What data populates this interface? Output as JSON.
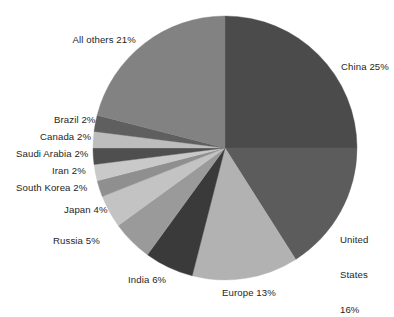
{
  "chart_data": {
    "type": "pie",
    "title": "",
    "subtitle": "",
    "xlabel": "",
    "ylabel": "",
    "legend_position": "none",
    "grid": false,
    "unit": "%",
    "start_angle_deg": 0,
    "direction": "clockwise",
    "categories": [
      "China",
      "United States",
      "Europe",
      "India",
      "Russia",
      "Japan",
      "South Korea",
      "Iran",
      "Saudi Arabia",
      "Canada",
      "Brazil",
      "All others"
    ],
    "values": [
      25,
      16,
      13,
      6,
      5,
      4,
      2,
      2,
      2,
      2,
      2,
      21
    ],
    "slices": [
      {
        "name": "China",
        "value": 25,
        "label": "China 25%",
        "label_lines": [
          "China 25%"
        ],
        "color": "#4b4b4b"
      },
      {
        "name": "United States",
        "value": 16,
        "label": "United States 16%",
        "label_lines": [
          "United",
          "States",
          "16%"
        ],
        "color": "#5c5c5c"
      },
      {
        "name": "Europe",
        "value": 13,
        "label": "Europe 13%",
        "label_lines": [
          "Europe 13%"
        ],
        "color": "#b2b2b2"
      },
      {
        "name": "India",
        "value": 6,
        "label": "India 6%",
        "label_lines": [
          "India 6%"
        ],
        "color": "#3a3a3a"
      },
      {
        "name": "Russia",
        "value": 5,
        "label": "Russia 5%",
        "label_lines": [
          "Russia 5%"
        ],
        "color": "#9a9a9a"
      },
      {
        "name": "Japan",
        "value": 4,
        "label": "Japan 4%",
        "label_lines": [
          "Japan 4%"
        ],
        "color": "#c3c3c3"
      },
      {
        "name": "South Korea",
        "value": 2,
        "label": "South Korea 2%",
        "label_lines": [
          "South Korea 2%"
        ],
        "color": "#8f8f8f"
      },
      {
        "name": "Iran",
        "value": 2,
        "label": "Iran 2%",
        "label_lines": [
          "Iran 2%"
        ],
        "color": "#c9c9c9"
      },
      {
        "name": "Saudi Arabia",
        "value": 2,
        "label": "Saudi Arabia 2%",
        "label_lines": [
          "Saudi Arabia 2%"
        ],
        "color": "#4f4f4f"
      },
      {
        "name": "Canada",
        "value": 2,
        "label": "Canada 2%",
        "label_lines": [
          "Canada 2%"
        ],
        "color": "#bdbdbd"
      },
      {
        "name": "Brazil",
        "value": 2,
        "label": "Brazil 2%",
        "label_lines": [
          "Brazil 2%"
        ],
        "color": "#5f5f5f"
      },
      {
        "name": "All others",
        "value": 21,
        "label": "All others 21%",
        "label_lines": [
          "All others 21%"
        ],
        "color": "#828282"
      }
    ]
  },
  "labels": {
    "china": "China 25%",
    "united_states_line1": "United",
    "united_states_line2": "States",
    "united_states_line3": "16%",
    "europe": "Europe 13%",
    "india": "India 6%",
    "russia": "Russia 5%",
    "japan": "Japan 4%",
    "south_korea": "South Korea 2%",
    "iran": "Iran 2%",
    "saudi_arabia": "Saudi Arabia 2%",
    "canada": "Canada 2%",
    "brazil": "Brazil 2%",
    "all_others": "All others 21%"
  },
  "geometry": {
    "center_x": 225,
    "center_y": 148,
    "radius": 132
  }
}
